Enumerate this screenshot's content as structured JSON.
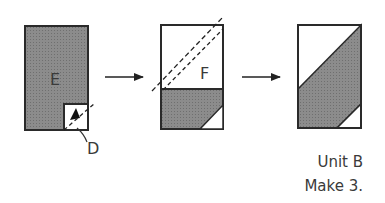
{
  "diagram": {
    "type": "quilt-piecing-steps",
    "colors": {
      "fabric_gray": "#8a8a8a",
      "outline": "#2a2a2a",
      "background": "#ffffff"
    },
    "steps": [
      {
        "id": "step1",
        "piece_label": "E",
        "corner_label": "D"
      },
      {
        "id": "step2",
        "piece_label": "F"
      },
      {
        "id": "step3",
        "piece_label": ""
      }
    ],
    "arrows": [
      {
        "from": "step1",
        "to": "step2"
      },
      {
        "from": "step2",
        "to": "step3"
      }
    ],
    "caption": {
      "line1": "Unit B",
      "line2": "Make 3."
    }
  }
}
